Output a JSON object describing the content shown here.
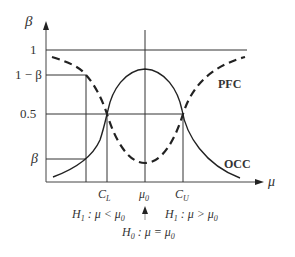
{
  "diagram": {
    "y_axis": {
      "label": "β"
    },
    "x_axis": {
      "label": "μ"
    },
    "y_ticks": [
      {
        "label": "1",
        "value": 1.0
      },
      {
        "label": "1 − β",
        "value": 0.8
      },
      {
        "label": "0.5",
        "value": 0.5
      },
      {
        "label": "β",
        "value": 0.2
      }
    ],
    "x_ticks": [
      {
        "label": "C",
        "sub": "L"
      },
      {
        "label": "μ",
        "sub": "0"
      },
      {
        "label": "C",
        "sub": "U"
      }
    ],
    "curves": [
      {
        "name": "PFC",
        "style": "dashed",
        "description": "Power function curve, U-shaped with minimum at μ0"
      },
      {
        "name": "OCC",
        "style": "solid",
        "description": "Operating characteristic curve, bell-shaped with maximum at μ0"
      }
    ],
    "hypotheses": {
      "h1_left": {
        "H": "H",
        "sub": "1",
        "text": " : μ < μ",
        "tail_sub": "0"
      },
      "h1_right": {
        "H": "H",
        "sub": "1",
        "text": " : μ > μ",
        "tail_sub": "0"
      },
      "h0": {
        "H": "H",
        "sub": "0",
        "text": " : μ = μ",
        "tail_sub": "0"
      }
    },
    "colors": {
      "line": "#333333",
      "grid": "#333333",
      "background": "#ffffff"
    }
  }
}
